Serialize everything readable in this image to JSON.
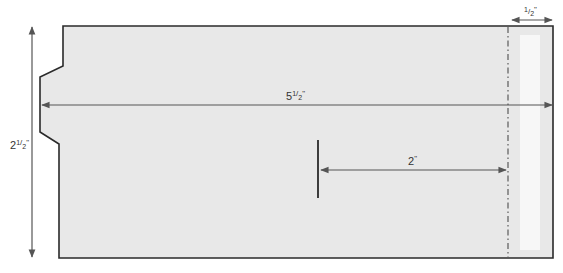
{
  "diagram": {
    "type": "envelope-template",
    "colors": {
      "fill": "#e8e8e8",
      "outline": "#2a2a2a",
      "dimension": "#555555",
      "strip": "#f7f7f7"
    },
    "dimensions": {
      "width": {
        "whole": "5",
        "frac_num": "1",
        "frac_den": "2",
        "unit": "\""
      },
      "height": {
        "whole": "2",
        "frac_num": "1",
        "frac_den": "2",
        "unit": "\""
      },
      "strip_width": {
        "whole": "",
        "frac_num": "1",
        "frac_den": "2",
        "unit": "\""
      },
      "offset": {
        "whole": "2",
        "frac_num": "",
        "frac_den": "",
        "unit": "\""
      }
    }
  }
}
